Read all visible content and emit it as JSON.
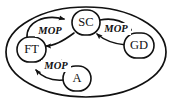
{
  "diagram": {
    "container": {
      "name": "outer-ellipse",
      "shape": "ellipse"
    },
    "colors": {
      "stroke": "#111111",
      "background": "#ffffff"
    },
    "nodes": [
      {
        "id": "SC",
        "label": "SC",
        "position": "top-center"
      },
      {
        "id": "FT",
        "label": "FT",
        "position": "left"
      },
      {
        "id": "GD",
        "label": "GD",
        "position": "right"
      },
      {
        "id": "A",
        "label": "A",
        "position": "bottom-center"
      }
    ],
    "edges": [
      {
        "id": "ft-sc",
        "from": "FT",
        "to": "SC",
        "label": "MOP"
      },
      {
        "id": "sc-ft",
        "from": "SC",
        "to": "FT",
        "label": ""
      },
      {
        "id": "sc-gd",
        "from": "SC",
        "to": "GD",
        "label": "MOP"
      },
      {
        "id": "gd-sc",
        "from": "GD",
        "to": "SC",
        "label": ""
      },
      {
        "id": "ft-a",
        "from": "FT",
        "to": "A",
        "label": "MOP"
      },
      {
        "id": "a-ft",
        "from": "A",
        "to": "FT",
        "label": ""
      }
    ],
    "edge_labels": {
      "top_left": "MOP",
      "top_right": "MOP",
      "bottom_left": "MOP"
    }
  }
}
